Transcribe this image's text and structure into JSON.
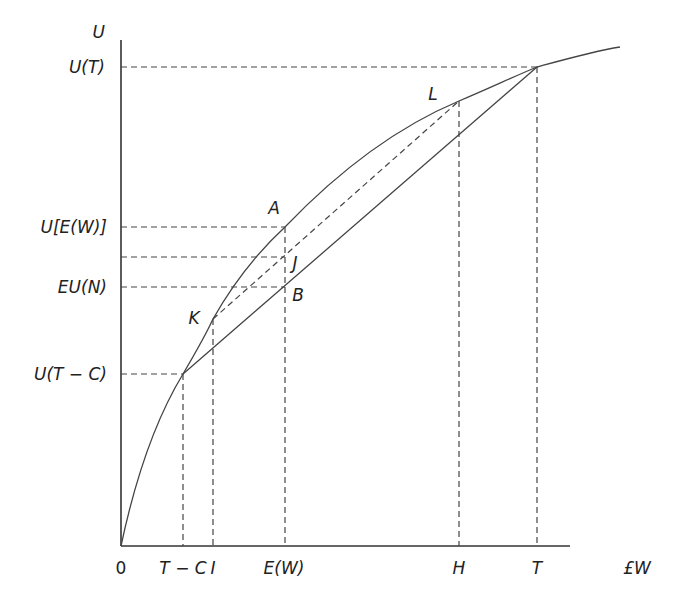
{
  "figure": {
    "type": "expected-utility diagram",
    "y_axis_label": "U",
    "x_axis_label": "£W",
    "origin_label": "0",
    "y_ticks": [
      "U(T)",
      "U[E(W)]",
      "EU(N)",
      "U(T − C)"
    ],
    "x_ticks": [
      "T − C",
      "I",
      "E(W)",
      "H",
      "T"
    ],
    "points": {
      "A": "A",
      "B": "B",
      "J": "J",
      "K": "K",
      "L": "L"
    },
    "colors": {
      "line": "#444444",
      "text": "#222222",
      "background": "#ffffff"
    }
  }
}
